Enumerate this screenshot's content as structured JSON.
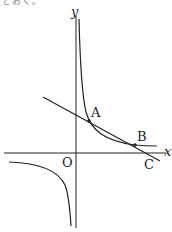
{
  "cropped_top_text": "とおく。",
  "labels": {
    "y_axis": "y",
    "x_axis": "x",
    "origin": "O",
    "point_a": "A",
    "point_b": "B",
    "point_c": "C"
  },
  "colors": {
    "stroke": "#222222",
    "background": "#ffffff"
  }
}
